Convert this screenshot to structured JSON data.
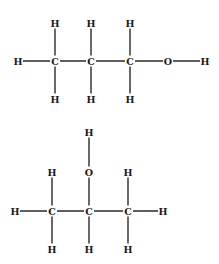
{
  "diagram": {
    "molecules": [
      {
        "name": "1-propanol",
        "atoms": [
          {
            "id": "h1",
            "label": "H",
            "x": 18,
            "y": 61
          },
          {
            "id": "c1",
            "label": "C",
            "x": 55,
            "y": 61
          },
          {
            "id": "c2",
            "label": "C",
            "x": 91,
            "y": 61
          },
          {
            "id": "c3",
            "label": "C",
            "x": 130,
            "y": 61
          },
          {
            "id": "o1",
            "label": "O",
            "x": 168,
            "y": 61
          },
          {
            "id": "h2",
            "label": "H",
            "x": 205,
            "y": 61
          },
          {
            "id": "h3",
            "label": "H",
            "x": 55,
            "y": 23
          },
          {
            "id": "h4",
            "label": "H",
            "x": 91,
            "y": 23
          },
          {
            "id": "h5",
            "label": "H",
            "x": 130,
            "y": 23
          },
          {
            "id": "h6",
            "label": "H",
            "x": 55,
            "y": 99
          },
          {
            "id": "h7",
            "label": "H",
            "x": 91,
            "y": 99
          },
          {
            "id": "h8",
            "label": "H",
            "x": 130,
            "y": 99
          }
        ],
        "bonds": [
          [
            "h1",
            "c1"
          ],
          [
            "c1",
            "c2"
          ],
          [
            "c2",
            "c3"
          ],
          [
            "c3",
            "o1"
          ],
          [
            "o1",
            "h2"
          ],
          [
            "h3",
            "c1"
          ],
          [
            "c1",
            "h6"
          ],
          [
            "h4",
            "c2"
          ],
          [
            "c2",
            "h7"
          ],
          [
            "h5",
            "c3"
          ],
          [
            "c3",
            "h8"
          ]
        ]
      },
      {
        "name": "2-propanol",
        "atoms": [
          {
            "id": "h1",
            "label": "H",
            "x": 89,
            "y": 132
          },
          {
            "id": "o1",
            "label": "O",
            "x": 89,
            "y": 172
          },
          {
            "id": "h2",
            "label": "H",
            "x": 52,
            "y": 172
          },
          {
            "id": "h3",
            "label": "H",
            "x": 128,
            "y": 172
          },
          {
            "id": "h4",
            "label": "H",
            "x": 15,
            "y": 211
          },
          {
            "id": "c1",
            "label": "C",
            "x": 52,
            "y": 211
          },
          {
            "id": "c2",
            "label": "C",
            "x": 89,
            "y": 211
          },
          {
            "id": "c3",
            "label": "C",
            "x": 128,
            "y": 211
          },
          {
            "id": "h5",
            "label": "H",
            "x": 163,
            "y": 211
          },
          {
            "id": "h6",
            "label": "H",
            "x": 52,
            "y": 249
          },
          {
            "id": "h7",
            "label": "H",
            "x": 89,
            "y": 249
          },
          {
            "id": "h8",
            "label": "H",
            "x": 128,
            "y": 249
          }
        ],
        "bonds": [
          [
            "h1",
            "o1"
          ],
          [
            "o1",
            "c2"
          ],
          [
            "h2",
            "c1"
          ],
          [
            "h3",
            "c3"
          ],
          [
            "h4",
            "c1"
          ],
          [
            "c1",
            "c2"
          ],
          [
            "c2",
            "c3"
          ],
          [
            "c3",
            "h5"
          ],
          [
            "c1",
            "h6"
          ],
          [
            "c2",
            "h7"
          ],
          [
            "c3",
            "h8"
          ]
        ]
      }
    ]
  }
}
